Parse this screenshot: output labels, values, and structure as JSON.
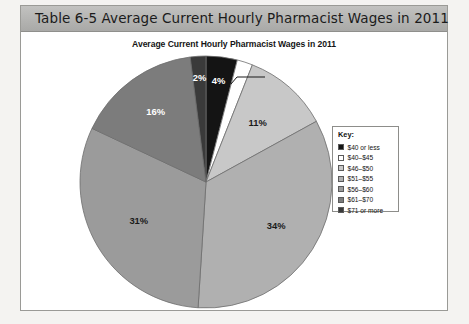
{
  "table_header": {
    "label": "Table 6-5  Average Current Hourly Pharmacist Wages in 2011"
  },
  "chart_data": {
    "type": "pie",
    "title": "Average Current Hourly Pharmacist Wages in 2011",
    "legend_title": "Key:",
    "legend_position": "right",
    "categories": [
      "$40 or less",
      "$40–$45",
      "$46–$50",
      "$51–$55",
      "$56–$60",
      "$61–$70",
      "$71 or more"
    ],
    "values": [
      4,
      2,
      11,
      34,
      31,
      16,
      2
    ],
    "value_labels": [
      "4%",
      "2%",
      "11%",
      "34%",
      "31%",
      "16%",
      "2%"
    ],
    "colors": [
      "#141414",
      "#ffffff",
      "#c8c8c8",
      "#b0b0b0",
      "#9b9b9b",
      "#7c7c7c",
      "#3a3a3a"
    ],
    "slice_order": "clockwise from 12 o'clock",
    "xlabel": "",
    "ylabel": ""
  },
  "slices": [
    {
      "label": "4%",
      "category": "$40 or less",
      "value": 4,
      "label_color": "light"
    },
    {
      "label": "2%",
      "category": "$40–$45",
      "value": 2,
      "label_color": "dark"
    },
    {
      "label": "11%",
      "category": "$46–$50",
      "value": 11,
      "label_color": "dark"
    },
    {
      "label": "34%",
      "category": "$51–$55",
      "value": 34,
      "label_color": "dark"
    },
    {
      "label": "31%",
      "category": "$56–$60",
      "value": 31,
      "label_color": "dark"
    },
    {
      "label": "16%",
      "category": "$61–$70",
      "value": 16,
      "label_color": "light"
    },
    {
      "label": "2%",
      "category": "$71 or more",
      "value": 2,
      "label_color": "light"
    }
  ],
  "legend": {
    "title": "Key:",
    "items": [
      {
        "label": "$40 or less",
        "color": "#141414"
      },
      {
        "label": "$40–$45",
        "color": "#ffffff"
      },
      {
        "label": "$46–$50",
        "color": "#c8c8c8"
      },
      {
        "label": "$51–$55",
        "color": "#b0b0b0"
      },
      {
        "label": "$56–$60",
        "color": "#9b9b9b"
      },
      {
        "label": "$61–$70",
        "color": "#7c7c7c"
      },
      {
        "label": "$71 or more",
        "color": "#3a3a3a"
      }
    ]
  }
}
